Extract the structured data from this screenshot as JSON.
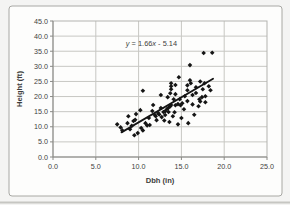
{
  "page": {
    "background": "#f4f4f3",
    "frame": {
      "x": 9,
      "y": 6,
      "width": 273,
      "height": 190,
      "fill": "#fdfdfc",
      "border_color": "#a8a8a4",
      "corner_radius": 3
    },
    "scan_edge_color": "#c6c6c2"
  },
  "chart_data": {
    "type": "scatter",
    "title": "",
    "xlabel": "Dbh (in)",
    "ylabel": "Height (ft)",
    "xlim": [
      0,
      25
    ],
    "ylim": [
      0,
      45
    ],
    "xticks": [
      "0.0",
      "5.0",
      "10.0",
      "15.0",
      "20.0",
      "25.0"
    ],
    "yticks": [
      "0.0",
      "5.0",
      "10.0",
      "15.0",
      "20.0",
      "25.0",
      "30.0",
      "35.0",
      "40.0",
      "45.0"
    ],
    "grid": true,
    "legend": "none",
    "annotation": {
      "text": "y = 1.66x - 5.14",
      "parts": [
        {
          "t": "y",
          "italic": true
        },
        {
          "t": " = 1.66",
          "italic": false
        },
        {
          "t": "x",
          "italic": true
        },
        {
          "t": " - 5.14",
          "italic": false
        }
      ],
      "x": 11.5,
      "y": 37.7
    },
    "trendline": {
      "slope": 1.66,
      "intercept": -5.14,
      "x_start": 8.0,
      "x_end": 18.7,
      "color": "#141414",
      "width": 1.8
    },
    "marker": {
      "shape": "diamond",
      "color": "#151515",
      "half_size": 2.3
    },
    "colors": {
      "grid": "#c7c7c3",
      "plot_border": "#b3b3af",
      "axis": "#8a8a86",
      "tick_text": "#3d3d3d",
      "title_text": "#2e2e2e"
    },
    "points": [
      [
        7.5,
        10.8
      ],
      [
        7.9,
        9.8
      ],
      [
        8.1,
        8.8
      ],
      [
        8.7,
        11.2
      ],
      [
        8.8,
        13.5
      ],
      [
        9.0,
        9.2
      ],
      [
        9.2,
        10.3
      ],
      [
        9.4,
        11.9
      ],
      [
        9.5,
        7.2
      ],
      [
        9.6,
        12.3
      ],
      [
        9.7,
        14.2
      ],
      [
        9.9,
        7.9
      ],
      [
        10.2,
        15.5
      ],
      [
        10.3,
        9.6
      ],
      [
        10.5,
        8.8
      ],
      [
        10.5,
        21.9
      ],
      [
        10.8,
        11.2
      ],
      [
        11.0,
        10.4
      ],
      [
        11.2,
        12.9
      ],
      [
        11.3,
        10.6
      ],
      [
        11.6,
        15.2
      ],
      [
        11.7,
        17.2
      ],
      [
        11.9,
        13.9
      ],
      [
        12.0,
        13.5
      ],
      [
        12.1,
        12.2
      ],
      [
        12.3,
        14.5
      ],
      [
        12.4,
        14.1
      ],
      [
        12.6,
        16.2
      ],
      [
        12.6,
        20.5
      ],
      [
        12.7,
        13.2
      ],
      [
        12.9,
        14.9
      ],
      [
        13.0,
        12.1
      ],
      [
        13.1,
        13.9
      ],
      [
        13.1,
        15.1
      ],
      [
        13.3,
        15.8
      ],
      [
        13.4,
        19.8
      ],
      [
        13.5,
        14.9
      ],
      [
        13.5,
        16.3
      ],
      [
        13.6,
        11.6
      ],
      [
        13.7,
        16.8
      ],
      [
        13.7,
        21.1
      ],
      [
        13.8,
        17.2
      ],
      [
        13.8,
        22.4
      ],
      [
        13.8,
        23.4
      ],
      [
        13.8,
        24.4
      ],
      [
        14.0,
        13.5
      ],
      [
        14.1,
        19.1
      ],
      [
        14.2,
        14.8
      ],
      [
        14.3,
        17.1
      ],
      [
        14.3,
        20.8
      ],
      [
        14.3,
        23.8
      ],
      [
        14.6,
        10.8
      ],
      [
        14.6,
        17.5
      ],
      [
        14.7,
        26.4
      ],
      [
        14.8,
        19.1
      ],
      [
        14.9,
        17.1
      ],
      [
        15.0,
        12.9
      ],
      [
        15.1,
        17.8
      ],
      [
        15.3,
        15.8
      ],
      [
        15.4,
        20.1
      ],
      [
        15.7,
        18.5
      ],
      [
        15.7,
        22.1
      ],
      [
        15.7,
        23.7
      ],
      [
        15.8,
        11.2
      ],
      [
        16.0,
        25.4
      ],
      [
        16.0,
        30.4
      ],
      [
        16.1,
        24.4
      ],
      [
        16.3,
        17.4
      ],
      [
        16.3,
        20.5
      ],
      [
        16.5,
        14.0
      ],
      [
        16.7,
        21.2
      ],
      [
        16.7,
        23.1
      ],
      [
        17.0,
        16.8
      ],
      [
        17.1,
        19.1
      ],
      [
        17.2,
        18.4
      ],
      [
        17.2,
        25.0
      ],
      [
        17.4,
        19.8
      ],
      [
        17.5,
        22.4
      ],
      [
        17.6,
        34.4
      ],
      [
        17.7,
        24.4
      ],
      [
        17.8,
        18.1
      ],
      [
        17.8,
        20.1
      ],
      [
        18.2,
        23.4
      ],
      [
        18.4,
        22.1
      ],
      [
        18.6,
        34.5
      ]
    ],
    "plot_area_px": {
      "left": 53,
      "top": 21,
      "right": 267,
      "bottom": 157
    }
  }
}
